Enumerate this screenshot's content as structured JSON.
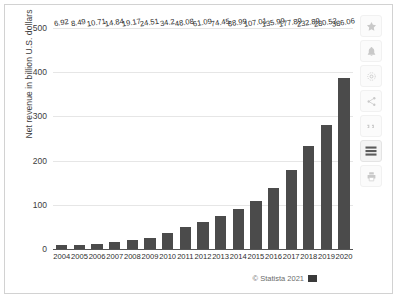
{
  "chart_data": {
    "type": "bar",
    "title": "",
    "subtitle": "",
    "xlabel": "",
    "ylabel": "Net revenue in billion U.S. dollars",
    "categories": [
      "2004",
      "2005",
      "2006",
      "2007",
      "2008",
      "2009",
      "2010",
      "2011",
      "2012",
      "2013",
      "2014",
      "2015",
      "2016",
      "2017",
      "2018",
      "2019",
      "2020"
    ],
    "values": [
      6.92,
      8.49,
      10.71,
      14.84,
      19.17,
      24.51,
      34.2,
      48.08,
      61.09,
      74.45,
      88.99,
      107.01,
      135.99,
      177.89,
      232.89,
      280.52,
      386.06
    ],
    "value_labels": [
      "6.92",
      "8.49",
      "10.71",
      "14.84",
      "19.17",
      "24.51",
      "34.2",
      "48.08",
      "61.09",
      "74.45",
      "88.99",
      "107.01",
      "135.99",
      "177.89",
      "232.89",
      "280.52",
      "386.06"
    ],
    "ylim": [
      0,
      500
    ],
    "yticks": [
      0,
      100,
      200,
      300,
      400,
      500
    ],
    "ytick_labels": [
      "0",
      "100",
      "200",
      "300",
      "400",
      "500"
    ],
    "grid": true,
    "legend": false,
    "bar_color": "#4b4b4b",
    "gridline_color": "#e6e6e6",
    "axis_color": "#555555"
  },
  "credit": {
    "text": "© Statista 2021",
    "flag_icon": "statista-flag-icon"
  },
  "toolbar": {
    "items": [
      {
        "name": "favorite-star-icon",
        "label": "Favorite",
        "active": false
      },
      {
        "name": "notification-bell-icon",
        "label": "Notifications",
        "active": false
      },
      {
        "name": "settings-gear-icon",
        "label": "Settings",
        "active": false
      },
      {
        "name": "share-icon",
        "label": "Share",
        "active": false
      },
      {
        "name": "citation-quote-icon",
        "label": "Citation",
        "active": false
      },
      {
        "name": "table-rows-icon",
        "label": "Show table",
        "active": true
      },
      {
        "name": "print-icon",
        "label": "Print",
        "active": false
      }
    ]
  }
}
